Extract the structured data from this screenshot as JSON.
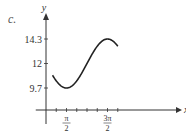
{
  "panel_label": "c.",
  "chart_data": {
    "type": "line",
    "title": "",
    "xlabel": "x",
    "ylabel": "y",
    "xlim": [
      -0.785,
      5.89
    ],
    "ylim": [
      7.2,
      15.6
    ],
    "x_ticks": [
      0.785,
      1.571,
      2.356,
      3.142,
      3.927,
      4.712,
      5.498
    ],
    "x_tick_labels": [
      {
        "x": 1.571,
        "num": "π",
        "den": "2"
      },
      {
        "x": 4.712,
        "num": "3π",
        "den": "2"
      }
    ],
    "y_ticks": [
      9.7,
      12,
      14.3
    ],
    "y_tick_labels": [
      "9.7",
      "12",
      "14.3"
    ],
    "series": [
      {
        "name": "y = 12 - 2.3 sin(x)",
        "function": {
          "a": 12,
          "b": -2.3
        },
        "x_range": [
          0.5,
          5.5
        ],
        "color": "#222222"
      }
    ],
    "grid": false,
    "legend": "none"
  }
}
